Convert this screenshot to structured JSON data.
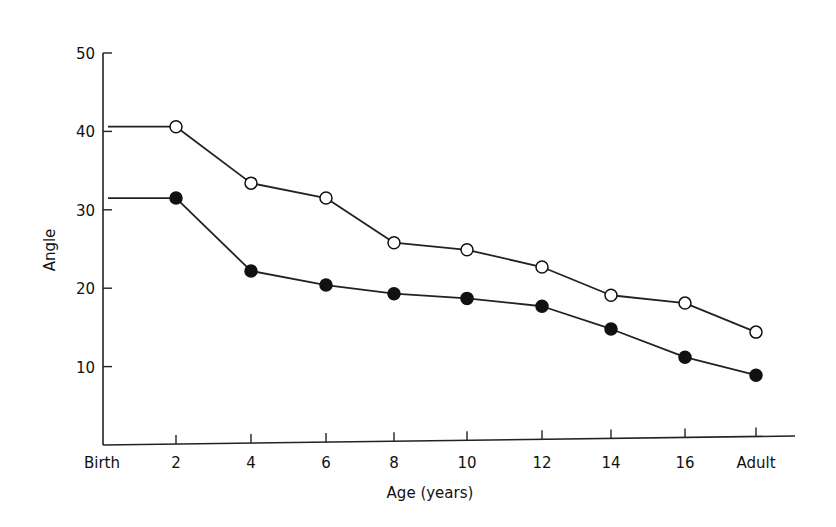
{
  "chart_data": {
    "type": "line",
    "title": "",
    "xlabel": "Age (years)",
    "ylabel": "Angle",
    "categories": [
      "Birth",
      "2",
      "4",
      "6",
      "8",
      "10",
      "12",
      "14",
      "16",
      "Adult"
    ],
    "yticks": [
      10,
      20,
      30,
      40,
      50
    ],
    "ylim": [
      0,
      50
    ],
    "grid": false,
    "legend": null,
    "series": [
      {
        "name": "open-circles",
        "marker": "open-circle",
        "values": [
          40.6,
          40.6,
          33.4,
          31.5,
          25.8,
          24.9,
          22.7,
          19.1,
          18.1,
          14.4
        ],
        "note": "Birth value shown as horizontal line extending to age 2"
      },
      {
        "name": "filled-circles",
        "marker": "filled-circle",
        "values": [
          31.5,
          31.5,
          22.2,
          20.4,
          19.3,
          18.7,
          17.7,
          14.8,
          11.2,
          8.9
        ],
        "note": "Birth value shown as horizontal line extending to age 2"
      }
    ]
  },
  "axes": {
    "x_title": "Age (years)",
    "y_title": "Angle",
    "x_ticks": [
      "Birth",
      "2",
      "4",
      "6",
      "8",
      "10",
      "12",
      "14",
      "16",
      "Adult"
    ],
    "y_ticks": [
      "10",
      "20",
      "30",
      "40",
      "50"
    ]
  }
}
